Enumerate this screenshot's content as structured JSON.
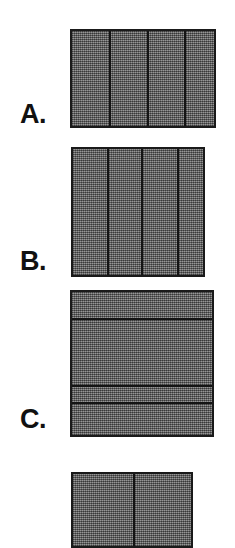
{
  "figure": {
    "background_color": "#ffffff",
    "fill_color": "#6e6e6e",
    "border_color": "#1a1a1a",
    "label_color": "#111111",
    "panels": [
      {
        "id": "a",
        "label": "A.",
        "label_x": 20,
        "label_y": 101,
        "orientation": "columns",
        "x": 70,
        "y": 29,
        "width": 146,
        "height": 99,
        "cell_count": 4,
        "cell_sizes": [
          37,
          36,
          35,
          34
        ]
      },
      {
        "id": "b",
        "label": "B.",
        "label_x": 20,
        "label_y": 248,
        "orientation": "columns",
        "x": 71,
        "y": 147,
        "width": 134,
        "height": 130,
        "cell_count": 4,
        "cell_sizes": [
          34,
          32,
          34,
          30
        ]
      },
      {
        "id": "c",
        "label": "C.",
        "label_x": 20,
        "label_y": 406,
        "orientation": "rows",
        "x": 70,
        "y": 290,
        "width": 144,
        "height": 147,
        "cell_count": 4,
        "cell_sizes": [
          26,
          65,
          15,
          39
        ]
      },
      {
        "id": "d",
        "label": "",
        "label_x": 20,
        "label_y": 560,
        "orientation": "columns",
        "x": 71,
        "y": 472,
        "width": 122,
        "height": 76,
        "cell_count": 2,
        "cell_sizes": [
          60,
          60
        ]
      }
    ]
  }
}
